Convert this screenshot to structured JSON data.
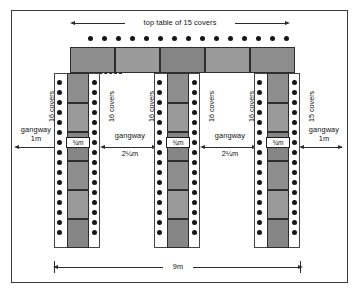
{
  "diagram": {
    "overall_width_label": "9m",
    "top_table_label": "top table of 15 covers",
    "top_table_covers": 15,
    "top_table_segments": 5,
    "gangway_label": "gangway",
    "gangway_outer_width": "1m",
    "gangway_inner_width": "2¼m",
    "table_width_label": "¾m",
    "covers_16": "16 covers",
    "covers_15": "15 covers",
    "vertical_tables": [
      {
        "name": "left-sprig-table",
        "left_covers": "16 covers",
        "right_covers": "16 covers",
        "left_chair_count": 16,
        "right_chair_count": 16,
        "width_label": "¾m",
        "segments": 6
      },
      {
        "name": "middle-sprig-table",
        "left_covers": "16 covers",
        "right_covers": "16 covers",
        "left_chair_count": 16,
        "right_chair_count": 16,
        "width_label": "¾m",
        "segments": 6
      },
      {
        "name": "right-sprig-table",
        "left_covers": "16 covers",
        "right_covers": "15 covers",
        "left_chair_count": 16,
        "right_chair_count": 16,
        "width_label": "¾m",
        "segments": 6
      }
    ],
    "gangways": [
      {
        "name": "left-outer-gangway",
        "label": "gangway",
        "width": "1m"
      },
      {
        "name": "first-inner-gangway",
        "label": "gangway",
        "width": "2¼m"
      },
      {
        "name": "second-inner-gangway",
        "label": "gangway",
        "width": "2¼m"
      },
      {
        "name": "right-outer-gangway",
        "label": "gangway",
        "width": "1m"
      }
    ],
    "colors": {
      "table_fill": "#8e8e8e",
      "chair": "#161616",
      "line": "#2b2b2b",
      "frame": "#3a3a3a",
      "background": "#ffffff"
    }
  }
}
